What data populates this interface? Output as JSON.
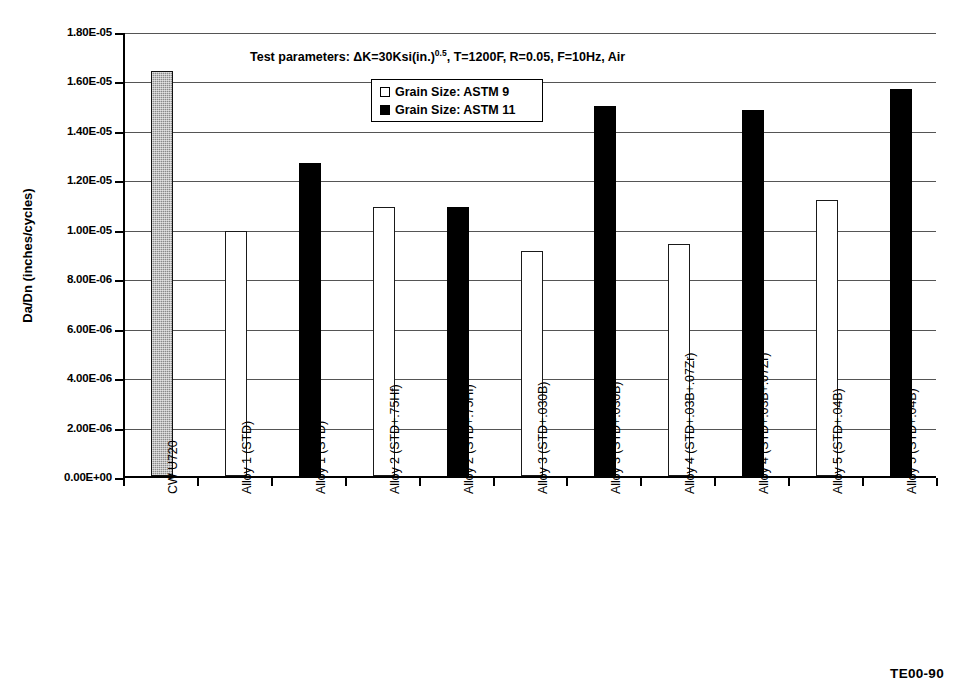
{
  "figure": {
    "annotation": "Test parameters: ΔK=30Ksi(in.)",
    "annotation_sup": "0.5",
    "annotation_rest": ", T=1200F, R=0.05, F=10Hz, Air",
    "footer_code": "TE00-90"
  },
  "legend": {
    "position": "inside-top-center",
    "entries": [
      {
        "label": "Grain Size: ASTM 9",
        "swatch": "open",
        "color": "#ffffff"
      },
      {
        "label": "Grain Size: ASTM 11",
        "swatch": "filled",
        "color": "#000000"
      }
    ]
  },
  "chart_data": {
    "type": "bar",
    "title": "",
    "xlabel": "",
    "ylabel": "Da/Dn (inches/cycles)",
    "ylim": [
      0,
      1.8e-05
    ],
    "grid": true,
    "ytick_labels": [
      "1.80E-05",
      "1.60E-05",
      "1.40E-05",
      "1.20E-05",
      "1.00E-05",
      "8.00E-06",
      "6.00E-06",
      "4.00E-06",
      "2.00E-06",
      "0.00E+00"
    ],
    "ytick_values": [
      1.8e-05,
      1.6e-05,
      1.4e-05,
      1.2e-05,
      1e-05,
      8e-06,
      6e-06,
      4e-06,
      2e-06,
      0
    ],
    "categories": [
      "CW U720",
      "Alloy 1 (STD)",
      "Alloy 1 (STD)",
      "Alloy 2 (STD+.75Hf)",
      "Alloy 2 (STD+.75Hf)",
      "Alloy 3 (STD+.030B)",
      "Alloy 3 (STD+.030B)",
      "Alloy 4 (STD+.03B+.07Zr)",
      "Alloy 4 (STD+.03B+.07Zr)",
      "Alloy 5 (STD+.04B)",
      "Alloy 5 (STD+.04B)"
    ],
    "values": [
      1.64e-05,
      9.9e-06,
      1.265e-05,
      1.09e-05,
      1.09e-05,
      9.1e-06,
      1.495e-05,
      9.4e-06,
      1.48e-05,
      1.115e-05,
      1.565e-05
    ],
    "value_labels": [
      "1.64E-05",
      "9.90E-06",
      "1.27E-05",
      "1.09E-05",
      "1.09E-05",
      "9.10E-06",
      "1.50E-05",
      "9.40E-06",
      "1.48E-05",
      "1.12E-05",
      "1.57E-05"
    ],
    "series_of_bar": [
      "CW U720",
      "Grain Size: ASTM 9",
      "Grain Size: ASTM 11",
      "Grain Size: ASTM 9",
      "Grain Size: ASTM 11",
      "Grain Size: ASTM 9",
      "Grain Size: ASTM 11",
      "Grain Size: ASTM 9",
      "Grain Size: ASTM 11",
      "Grain Size: ASTM 9",
      "Grain Size: ASTM 11"
    ],
    "bar_styles": [
      "cw",
      "astm9",
      "astm11",
      "astm9",
      "astm11",
      "astm9",
      "astm11",
      "astm9",
      "astm11",
      "astm9",
      "astm11"
    ]
  }
}
